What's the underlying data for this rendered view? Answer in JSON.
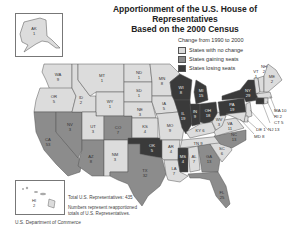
{
  "title": {
    "line1": "Apportionment of the U.S. House of Representatives",
    "line2": "Based on the 2000 Census"
  },
  "legend": {
    "heading": "Change from 1990 to 2000",
    "items": [
      {
        "label": "States with no change",
        "color": "#dcdcdc"
      },
      {
        "label": "States gaining seats",
        "color": "#8c8c8c"
      },
      {
        "label": "States losing seats",
        "color": "#3a3a3a"
      }
    ]
  },
  "notes": {
    "total": "Total U.S. Representatives: 435",
    "explain_line1": "Numbers represent reapportioned",
    "explain_line2": "totals of U.S. Representatives.",
    "source": "U.S. Department of Commerce"
  },
  "states": [
    {
      "abbr": "AK",
      "seats": "1",
      "status": "no_change"
    },
    {
      "abbr": "HI",
      "seats": "2",
      "status": "no_change"
    },
    {
      "abbr": "WA",
      "seats": "9",
      "status": "no_change"
    },
    {
      "abbr": "OR",
      "seats": "5",
      "status": "no_change"
    },
    {
      "abbr": "CA",
      "seats": "53",
      "status": "gain"
    },
    {
      "abbr": "NV",
      "seats": "3",
      "status": "gain"
    },
    {
      "abbr": "ID",
      "seats": "2",
      "status": "no_change"
    },
    {
      "abbr": "MT",
      "seats": "1",
      "status": "no_change"
    },
    {
      "abbr": "WY",
      "seats": "1",
      "status": "no_change"
    },
    {
      "abbr": "UT",
      "seats": "3",
      "status": "no_change"
    },
    {
      "abbr": "AZ",
      "seats": "8",
      "status": "gain"
    },
    {
      "abbr": "CO",
      "seats": "7",
      "status": "gain"
    },
    {
      "abbr": "NM",
      "seats": "3",
      "status": "no_change"
    },
    {
      "abbr": "ND",
      "seats": "1",
      "status": "no_change"
    },
    {
      "abbr": "SD",
      "seats": "1",
      "status": "no_change"
    },
    {
      "abbr": "NE",
      "seats": "3",
      "status": "no_change"
    },
    {
      "abbr": "KS",
      "seats": "4",
      "status": "no_change"
    },
    {
      "abbr": "OK",
      "seats": "5",
      "status": "lose"
    },
    {
      "abbr": "TX",
      "seats": "32",
      "status": "gain"
    },
    {
      "abbr": "MN",
      "seats": "8",
      "status": "no_change"
    },
    {
      "abbr": "IA",
      "seats": "5",
      "status": "no_change"
    },
    {
      "abbr": "MO",
      "seats": "9",
      "status": "no_change"
    },
    {
      "abbr": "AR",
      "seats": "4",
      "status": "no_change"
    },
    {
      "abbr": "LA",
      "seats": "7",
      "status": "no_change"
    },
    {
      "abbr": "WI",
      "seats": "8",
      "status": "lose"
    },
    {
      "abbr": "IL",
      "seats": "19",
      "status": "lose"
    },
    {
      "abbr": "MI",
      "seats": "15",
      "status": "lose"
    },
    {
      "abbr": "IN",
      "seats": "9",
      "status": "lose"
    },
    {
      "abbr": "OH",
      "seats": "18",
      "status": "lose"
    },
    {
      "abbr": "KY",
      "seats": "6",
      "status": "no_change"
    },
    {
      "abbr": "TN",
      "seats": "9",
      "status": "no_change"
    },
    {
      "abbr": "MS",
      "seats": "4",
      "status": "lose"
    },
    {
      "abbr": "AL",
      "seats": "7",
      "status": "no_change"
    },
    {
      "abbr": "GA",
      "seats": "13",
      "status": "gain"
    },
    {
      "abbr": "FL",
      "seats": "25",
      "status": "gain"
    },
    {
      "abbr": "SC",
      "seats": "6",
      "status": "no_change"
    },
    {
      "abbr": "NC",
      "seats": "13",
      "status": "gain"
    },
    {
      "abbr": "VA",
      "seats": "11",
      "status": "no_change"
    },
    {
      "abbr": "WV",
      "seats": "3",
      "status": "no_change"
    },
    {
      "abbr": "PA",
      "seats": "19",
      "status": "lose"
    },
    {
      "abbr": "NY",
      "seats": "29",
      "status": "lose"
    },
    {
      "abbr": "VT",
      "seats": "1",
      "status": "no_change"
    },
    {
      "abbr": "NH",
      "seats": "2",
      "status": "no_change"
    },
    {
      "abbr": "ME",
      "seats": "2",
      "status": "no_change"
    },
    {
      "abbr": "MA",
      "seats": "10",
      "status": "no_change"
    },
    {
      "abbr": "RI",
      "seats": "2",
      "status": "no_change"
    },
    {
      "abbr": "CT",
      "seats": "5",
      "status": "lose"
    },
    {
      "abbr": "NJ",
      "seats": "13",
      "status": "no_change"
    },
    {
      "abbr": "DE",
      "seats": "1",
      "status": "no_change"
    },
    {
      "abbr": "MD",
      "seats": "8",
      "status": "no_change"
    }
  ],
  "callouts": {
    "MA": "MA 10",
    "RI": "RI 2",
    "CT": "CT 5",
    "NJ": "NJ 13",
    "DE": "DE 1",
    "MD": "MD 8",
    "KY": "KY 6",
    "TN": "TN 9"
  }
}
